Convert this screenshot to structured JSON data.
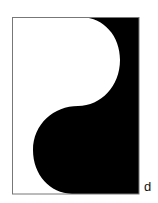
{
  "figure": {
    "panel_label": "d",
    "colors": {
      "fill": "#000000",
      "background": "#ffffff",
      "frame": "#777777"
    }
  }
}
